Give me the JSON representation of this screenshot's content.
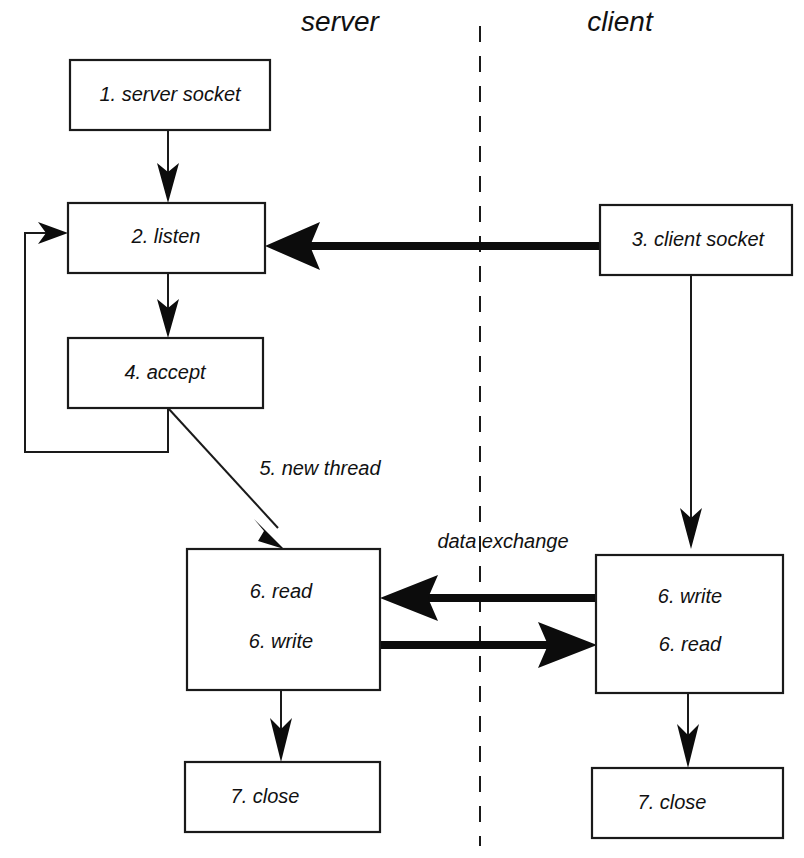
{
  "diagram": {
    "background_color": "#ffffff",
    "line_color": "#1a1a1a",
    "lanes": [
      {
        "id": "server",
        "label": "server",
        "x": 340,
        "y": 22
      },
      {
        "id": "client",
        "label": "client",
        "x": 620,
        "y": 22
      }
    ],
    "divider": {
      "name": "lane-divider",
      "style": "dashed",
      "x": 480,
      "y_top": 26,
      "y_bottom": 846
    },
    "nodes": [
      {
        "id": "server-socket",
        "lane": "server",
        "step": 1,
        "label": "1. server socket",
        "x": 70,
        "y": 60,
        "w": 200,
        "h": 70
      },
      {
        "id": "listen",
        "lane": "server",
        "step": 2,
        "label": "2. listen",
        "x": 68,
        "y": 203,
        "w": 197,
        "h": 70
      },
      {
        "id": "accept",
        "lane": "server",
        "step": 4,
        "label": "4. accept",
        "x": 68,
        "y": 338,
        "w": 195,
        "h": 70
      },
      {
        "id": "server-readwrite",
        "lane": "server",
        "step": 6,
        "label": "",
        "label_lines": [
          "6. read",
          "6. write"
        ],
        "x": 187,
        "y": 549,
        "w": 193,
        "h": 141
      },
      {
        "id": "server-close",
        "lane": "server",
        "step": 7,
        "label": "7. close",
        "x": 185,
        "y": 762,
        "w": 195,
        "h": 70
      },
      {
        "id": "client-socket",
        "lane": "client",
        "step": 3,
        "label": "3. client socket",
        "x": 600,
        "y": 205,
        "w": 192,
        "h": 70
      },
      {
        "id": "client-readwrite",
        "lane": "client",
        "step": 6,
        "label": "",
        "label_lines": [
          "6. write",
          "6. read"
        ],
        "x": 596,
        "y": 555,
        "w": 187,
        "h": 138
      },
      {
        "id": "client-close",
        "lane": "client",
        "step": 7,
        "label": "7. close",
        "x": 592,
        "y": 768,
        "w": 191,
        "h": 70
      }
    ],
    "edges": [
      {
        "id": "e1",
        "name": "server-socket-to-listen",
        "from": "server-socket",
        "to": "listen",
        "weight": "thin",
        "label": ""
      },
      {
        "id": "e2",
        "name": "listen-to-accept",
        "from": "listen",
        "to": "accept",
        "weight": "thin",
        "label": ""
      },
      {
        "id": "e3",
        "name": "accept-loop-back-to-listen",
        "from": "accept",
        "to": "listen",
        "weight": "thin",
        "label": ""
      },
      {
        "id": "e4",
        "name": "accept-to-server-readwrite",
        "from": "accept",
        "to": "server-readwrite",
        "weight": "thin",
        "label": "5. new thread",
        "label_x": 320,
        "label_y": 470
      },
      {
        "id": "e5",
        "name": "client-socket-to-listen-connect",
        "from": "client-socket",
        "to": "listen",
        "weight": "thick",
        "label": ""
      },
      {
        "id": "e6",
        "name": "client-socket-to-client-readwrite",
        "from": "client-socket",
        "to": "client-readwrite",
        "weight": "thin",
        "label": ""
      },
      {
        "id": "e7",
        "name": "client-write-to-server-read",
        "from": "client-readwrite",
        "to": "server-readwrite",
        "weight": "thick",
        "label": "data exchange",
        "label_x": 503,
        "label_y": 543
      },
      {
        "id": "e8",
        "name": "server-write-to-client-read",
        "from": "server-readwrite",
        "to": "client-readwrite",
        "weight": "thick",
        "label": ""
      },
      {
        "id": "e9",
        "name": "server-readwrite-to-server-close",
        "from": "server-readwrite",
        "to": "server-close",
        "weight": "thin",
        "label": ""
      },
      {
        "id": "e10",
        "name": "client-readwrite-to-client-close",
        "from": "client-readwrite",
        "to": "client-close",
        "weight": "thin",
        "label": ""
      }
    ],
    "edge_labels": {
      "new_thread": "5. new thread",
      "data_exchange": "data exchange"
    }
  }
}
